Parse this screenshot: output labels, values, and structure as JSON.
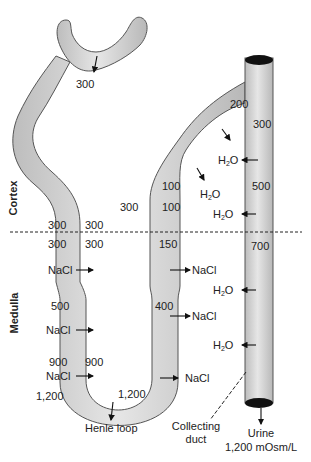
{
  "zones": {
    "cortex": "Cortex",
    "medulla": "Medulla"
  },
  "labels": {
    "glomerulus_in": "300",
    "distal_top": "200",
    "duct_top": "300",
    "cortex_interstitium": "300",
    "ascending_upper_1": "100",
    "ascending_upper_2": "100",
    "duct_cortex": "500",
    "border_left_outside_above": "300",
    "border_left_inside_above": "300",
    "border_left_outside_below": "300",
    "border_left_inside_below": "300",
    "ascending_border": "150",
    "duct_border": "700",
    "medulla_outer_1": "500",
    "ascending_lower": "400",
    "medulla_deep_outside": "900",
    "descending_deep": "900",
    "papilla_outside": "1,200",
    "loop_tip": "1,200"
  },
  "fluxes": {
    "h2o": "H",
    "h2o_sub": "2",
    "h2o_tail": "O",
    "nacl": "NaCl"
  },
  "captions": {
    "henle_loop": "Henle loop",
    "collecting_duct_1": "Collecting",
    "collecting_duct_2": "duct",
    "urine_1": "Urine",
    "urine_2": "1,200 mOsm/L"
  },
  "colors": {
    "tube_fill": "#d4d4d4",
    "tube_stroke": "#555555",
    "text": "#222222",
    "duct_cap": "#111111"
  }
}
